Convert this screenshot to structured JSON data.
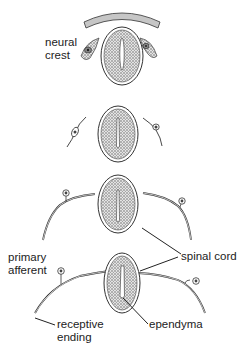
{
  "diagram": {
    "stages": [
      {
        "name": "stage-1",
        "description": "neural tube with neural crest cells and overlying ectoderm"
      },
      {
        "name": "stage-2",
        "description": "neural crest cells migrating with processes"
      },
      {
        "name": "stage-3",
        "description": "bipolar sensory neurons extending central and peripheral processes"
      },
      {
        "name": "stage-4",
        "description": "pseudo-unipolar primary afferents connecting to spinal cord"
      }
    ],
    "labels": {
      "neural_crest_line1": "neural",
      "neural_crest_line2": "crest",
      "primary_afferent_line1": "primary",
      "primary_afferent_line2": "afferent",
      "spinal_cord": "spinal cord",
      "receptive_ending_line1": "receptive",
      "receptive_ending_line2": "ending",
      "ependyma": "ependyma"
    },
    "colors": {
      "line": "#333333",
      "tissue_fill": "#d9d9d9",
      "text": "#222222",
      "background": "#ffffff"
    }
  }
}
